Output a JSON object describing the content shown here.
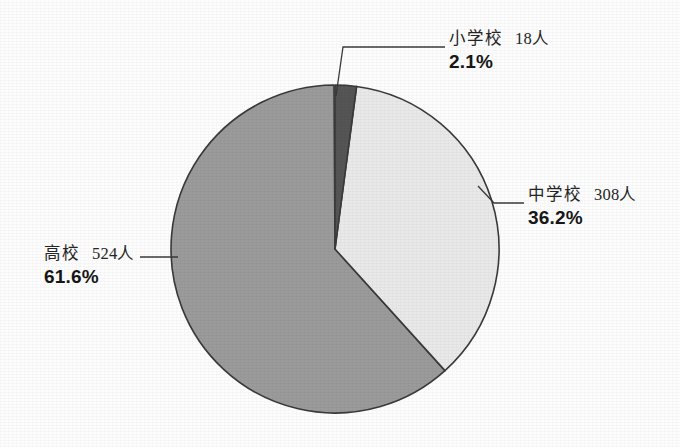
{
  "chart_data": {
    "type": "pie",
    "title": "",
    "subtitle": "",
    "xlabel": "",
    "ylabel": "",
    "legend_position": "none",
    "grid": false,
    "unit_suffix": "人",
    "total": 850,
    "start_angle_deg": 0,
    "direction": "clockwise",
    "categories": [
      "小学校",
      "中学校",
      "高校"
    ],
    "values": [
      18,
      308,
      524
    ],
    "percents": [
      2.1,
      36.2,
      61.6
    ],
    "colors": [
      "#555555",
      "#e9e9e9",
      "#9b9b9b"
    ],
    "slices": [
      {
        "name": "小学校",
        "count_label": "18人",
        "value": 18,
        "percent_label": "2.1%",
        "percent": 2.1,
        "color": "#555555"
      },
      {
        "name": "中学校",
        "count_label": "308人",
        "value": 308,
        "percent_label": "36.2%",
        "percent": 36.2,
        "color": "#e9e9e9"
      },
      {
        "name": "高校",
        "count_label": "524人",
        "value": 524,
        "percent_label": "61.6%",
        "percent": 61.6,
        "color": "#9b9b9b"
      }
    ]
  },
  "labels": {
    "shogakko": {
      "name": "小学校",
      "count": "18人",
      "percent": "2.1%"
    },
    "chugakko": {
      "name": "中学校",
      "count": "308人",
      "percent": "36.2%"
    },
    "koko": {
      "name": "高校",
      "count": "524人",
      "percent": "61.6%"
    }
  },
  "style": {
    "background": "#fdfdfd",
    "outline": "#3a3a3a",
    "leader_line": "#3a3a3a",
    "text": "#1d1d1d"
  }
}
